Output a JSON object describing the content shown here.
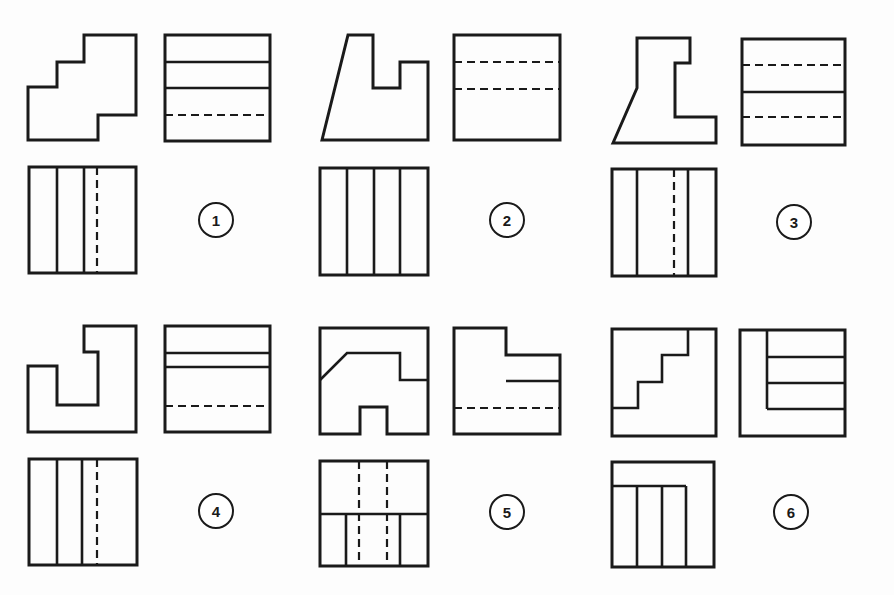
{
  "colors": {
    "ink": "#1a1a1a",
    "paper": "#fdfdfd"
  },
  "problems": [
    {
      "number": "1",
      "views": {
        "front": {
          "outline": "28,87 57,87 57,62 84,62 84,35 136,35 136,115 98,115 98,140 28,140"
        },
        "side": {
          "rect": [
            165,
            35,
            105,
            106
          ],
          "solid_h": [
            62,
            88
          ],
          "dashed_h": [
            115
          ]
        },
        "top": {
          "rect": [
            29,
            167,
            107,
            106
          ],
          "solid_v": [
            57,
            84
          ],
          "dashed_v": [
            97
          ]
        }
      },
      "label_pos": [
        216,
        220
      ]
    },
    {
      "number": "2",
      "views": {
        "front": {
          "outline": "322,140 348,35 373,35 373,88 400,88 400,62 428,62 428,140"
        },
        "side": {
          "rect": [
            454,
            35,
            106,
            105
          ],
          "solid_h": [],
          "dashed_h": [
            62,
            89
          ]
        },
        "top": {
          "rect": [
            320,
            168,
            108,
            107
          ],
          "solid_v": [
            347,
            374,
            400
          ],
          "dashed_v": []
        }
      },
      "label_pos": [
        507,
        220
      ]
    },
    {
      "number": "3",
      "views": {
        "front": {
          "outline": "613,143 637,88 637,38 690,38 690,63 675,63 675,117 716,117 716,143"
        },
        "side": {
          "rect": [
            742,
            39,
            103,
            106
          ],
          "solid_h": [
            92
          ],
          "dashed_h": [
            65,
            117
          ]
        },
        "top": {
          "rect": [
            612,
            169,
            104,
            107
          ],
          "solid_v": [
            637,
            688
          ],
          "dashed_v": [
            674
          ]
        }
      },
      "label_pos": [
        794,
        222
      ]
    },
    {
      "number": "4",
      "views": {
        "front": {
          "outline": "28,366 28,432 136,432 136,326 84,326 84,352 98,352 98,405 57,405 57,366"
        },
        "side": {
          "rect": [
            165,
            326,
            105,
            106
          ],
          "solid_h": [
            353,
            367
          ],
          "dashed_h": [
            406
          ]
        },
        "top": {
          "rect": [
            29,
            459,
            108,
            106
          ],
          "solid_v": [
            57,
            82
          ],
          "dashed_v": [
            97
          ]
        }
      },
      "label_pos": [
        216,
        511
      ]
    },
    {
      "number": "5",
      "views": {
        "front": {
          "outline": "320,328 428,328 428,434 387,434 387,407 360,407 360,434 320,434",
          "inner": "320,380 347,353 400,353 400,380 428,380"
        },
        "side": {
          "outline": "454,328 506,328 506,355 560,355 560,434 454,434",
          "solid_seg": [
            506,
            381,
            560,
            381
          ],
          "dashed_h": [
            408
          ]
        },
        "top": {
          "rect": [
            320,
            461,
            108,
            105
          ],
          "solid_h": [
            514
          ],
          "solid_v_lower": [
            346,
            400
          ],
          "dashed_v": [
            359,
            387
          ]
        }
      },
      "label_pos": [
        507,
        512
      ]
    },
    {
      "number": "6",
      "views": {
        "front": {
          "rect": [
            612,
            329,
            104,
            107
          ],
          "stair": "612,408 638,408 638,382 662,382 662,355 688,355 688,329"
        },
        "side": {
          "rect": [
            740,
            330,
            105,
            106
          ],
          "solid_v_seg": [
            767,
            330,
            767,
            409
          ],
          "solid_h_right": [
            357,
            383,
            409
          ]
        },
        "top": {
          "rect": [
            612,
            462,
            102,
            105
          ],
          "solid_h_seg": [
            612,
            486,
            686,
            486
          ],
          "solid_v_lower": [
            637,
            662,
            686
          ]
        }
      },
      "label_pos": [
        791,
        512
      ]
    }
  ]
}
